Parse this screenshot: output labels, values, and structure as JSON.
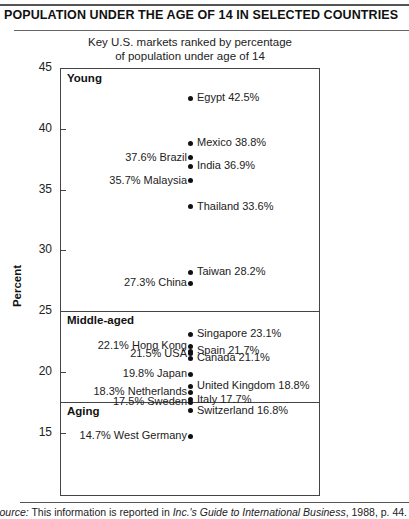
{
  "header": {
    "title": "POPULATION UNDER THE AGE OF 14 IN SELECTED COUNTRIES"
  },
  "chart_data": {
    "type": "scatter",
    "title": "POPULATION UNDER THE AGE OF 14 IN SELECTED COUNTRIES",
    "subtitle": "Key U.S. markets ranked by percentage of population under age of 14",
    "subtitle_lines": [
      "Key U.S. markets ranked by percentage",
      "of population under age of 14"
    ],
    "xlabel": "",
    "ylabel": "Percent",
    "ylim": [
      10,
      45
    ],
    "yticks": [
      45,
      40,
      35,
      30,
      25,
      20,
      15
    ],
    "grid": false,
    "legend": null,
    "groups": [
      {
        "name": "Young",
        "range": [
          25,
          45
        ]
      },
      {
        "name": "Middle-aged",
        "range": [
          17.6,
          25
        ]
      },
      {
        "name": "Aging",
        "range": [
          10,
          17.6
        ]
      }
    ],
    "points": [
      {
        "country": "Egypt",
        "value": 42.5,
        "label": "Egypt 42.5%",
        "side": "right",
        "group": "Young"
      },
      {
        "country": "Mexico",
        "value": 38.8,
        "label": "Mexico 38.8%",
        "side": "right",
        "group": "Young"
      },
      {
        "country": "Brazil",
        "value": 37.6,
        "label": "37.6% Brazil",
        "side": "left",
        "group": "Young"
      },
      {
        "country": "India",
        "value": 36.9,
        "label": "India 36.9%",
        "side": "right",
        "group": "Young"
      },
      {
        "country": "Malaysia",
        "value": 35.7,
        "label": "35.7% Malaysia",
        "side": "left",
        "group": "Young"
      },
      {
        "country": "Thailand",
        "value": 33.6,
        "label": "Thailand 33.6%",
        "side": "right",
        "group": "Young"
      },
      {
        "country": "Taiwan",
        "value": 28.2,
        "label": "Taiwan 28.2%",
        "side": "right",
        "group": "Young"
      },
      {
        "country": "China",
        "value": 27.3,
        "label": "27.3% China",
        "side": "left",
        "group": "Young"
      },
      {
        "country": "Singapore",
        "value": 23.1,
        "label": "Singapore 23.1%",
        "side": "right",
        "group": "Middle-aged"
      },
      {
        "country": "Hong Kong",
        "value": 22.1,
        "label": "22.1% Hong Kong",
        "side": "left",
        "group": "Middle-aged"
      },
      {
        "country": "Spain",
        "value": 21.7,
        "label": "Spain 21.7%",
        "side": "right",
        "group": "Middle-aged"
      },
      {
        "country": "USA",
        "value": 21.5,
        "label": "21.5% USA",
        "side": "left",
        "group": "Middle-aged"
      },
      {
        "country": "Canada",
        "value": 21.1,
        "label": "Canada 21.1%",
        "side": "right",
        "group": "Middle-aged"
      },
      {
        "country": "Japan",
        "value": 19.8,
        "label": "19.8% Japan",
        "side": "left",
        "group": "Middle-aged"
      },
      {
        "country": "United Kingdom",
        "value": 18.8,
        "label": "United Kingdom 18.8%",
        "side": "right",
        "group": "Middle-aged"
      },
      {
        "country": "Netherlands",
        "value": 18.3,
        "label": "18.3% Netherlands",
        "side": "left",
        "group": "Middle-aged"
      },
      {
        "country": "Italy",
        "value": 17.7,
        "label": "Italy 17.7%",
        "side": "right",
        "group": "Aging"
      },
      {
        "country": "Sweden",
        "value": 17.5,
        "label": "17.5% Sweden",
        "side": "left",
        "group": "Aging"
      },
      {
        "country": "Switzerland",
        "value": 16.8,
        "label": "Switzerland 16.8%",
        "side": "right",
        "group": "Aging"
      },
      {
        "country": "West Germany",
        "value": 14.7,
        "label": "14.7% West Germany",
        "side": "left",
        "group": "Aging"
      }
    ]
  },
  "footer": {
    "source_prefix": "Source:",
    "source_text": " This information is reported in ",
    "source_title": "Inc.'s Guide to International Business",
    "source_suffix": ", 1988, p. 44."
  }
}
